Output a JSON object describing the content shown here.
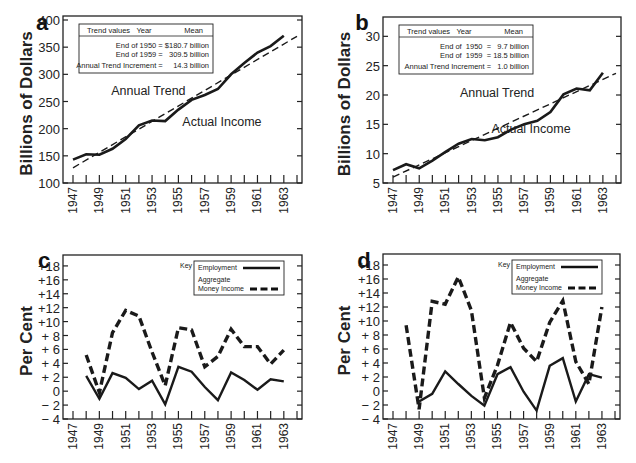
{
  "chart_data": [
    {
      "id": "a",
      "type": "line",
      "panel_label": "a",
      "ylabel": "Billions of Dollars",
      "ylim": [
        100,
        400
      ],
      "yticks": [
        100,
        150,
        200,
        250,
        300,
        350,
        400
      ],
      "ytick_labels": [
        "100",
        "150",
        "200",
        "250",
        "300",
        "350",
        "400"
      ],
      "xlim": [
        1947,
        1964
      ],
      "xtick_labels": [
        "1947",
        "1949",
        "1951",
        "1953",
        "1955",
        "1957",
        "1959",
        "1961",
        "1963"
      ],
      "x": [
        1947,
        1948,
        1949,
        1950,
        1951,
        1952,
        1953,
        1954,
        1955,
        1956,
        1957,
        1958,
        1959,
        1960,
        1961,
        1962,
        1963
      ],
      "series": [
        {
          "name": "Actual Income",
          "style": "solid",
          "values": [
            143,
            153,
            152,
            163,
            181,
            206,
            215,
            214,
            235,
            253,
            262,
            273,
            300,
            321,
            340,
            352,
            371
          ]
        },
        {
          "name": "Annual Trend",
          "style": "dashed",
          "x": [
            1947,
            1964
          ],
          "values": [
            128,
            370
          ]
        }
      ],
      "annotations": [
        {
          "text": "Annual Trend",
          "x": 1949.9,
          "y": 262
        },
        {
          "text": "Actual Income",
          "x": 1955.3,
          "y": 205
        }
      ],
      "table": {
        "headers": [
          "Trend values",
          "Year",
          "Mean"
        ],
        "rows": [
          "End of 1950 = $180.7 billion",
          "End of 1959 =   309.5 billion",
          "Annual Trend Increment =     14.3 billion"
        ]
      },
      "grid": false
    },
    {
      "id": "b",
      "type": "line",
      "panel_label": "b",
      "ylabel": "Billions of Dollars",
      "ylim": [
        5,
        35
      ],
      "yticks": [
        5,
        10,
        15,
        20,
        25,
        30
      ],
      "ytick_labels": [
        "5",
        "10",
        "15",
        "20",
        "25",
        "30"
      ],
      "xlim": [
        1947,
        1964
      ],
      "xtick_labels": [
        "1947",
        "1949",
        "1951",
        "1953",
        "1955",
        "1957",
        "1959",
        "1961",
        "1963"
      ],
      "x": [
        1947,
        1948,
        1949,
        1950,
        1951,
        1952,
        1953,
        1954,
        1955,
        1956,
        1957,
        1958,
        1959,
        1960,
        1961,
        1962,
        1963
      ],
      "series": [
        {
          "name": "Actual Income",
          "style": "solid",
          "values": [
            7.2,
            8.2,
            7.5,
            8.8,
            10.3,
            11.7,
            12.5,
            12.3,
            12.8,
            14.1,
            15.0,
            15.6,
            17.1,
            20.1,
            21.1,
            20.8,
            23.8
          ]
        },
        {
          "name": "Annual Trend",
          "style": "dashed",
          "x": [
            1947,
            1964
          ],
          "values": [
            6.0,
            23.7
          ]
        }
      ],
      "annotations": [
        {
          "text": "Annual Trend",
          "x": 1952.1,
          "y": 19.6
        },
        {
          "text": "Actual Income",
          "x": 1954.5,
          "y": 13.5
        }
      ],
      "table": {
        "headers": [
          "Trend values",
          "Year",
          "Mean"
        ],
        "rows": [
          "End of  1950  =   9.7 billion",
          "End of  1959  = 18.5 billion",
          "Annual Trend Increment =   1.0 billion"
        ]
      },
      "grid": false
    },
    {
      "id": "c",
      "type": "line",
      "panel_label": "c",
      "ylabel": "Per Cent",
      "ylim": [
        -4,
        20
      ],
      "yticks": [
        -4,
        -2,
        0,
        2,
        4,
        6,
        8,
        10,
        12,
        14,
        16,
        18
      ],
      "ytick_labels": [
        "− 4",
        "− 2",
        "0",
        "+ 2",
        "+ 4",
        "+ 6",
        "+ 8",
        "+10",
        "+12",
        "+14",
        "+16",
        "+18"
      ],
      "xlim": [
        1947,
        1964
      ],
      "xtick_labels": [
        "1947",
        "1949",
        "1951",
        "1953",
        "1955",
        "1957",
        "1959",
        "1961",
        "1963"
      ],
      "legend": {
        "key_label": "Key",
        "entries": [
          "Employment",
          "Aggregate",
          "Money Income"
        ],
        "position": "top-right"
      },
      "series": [
        {
          "name": "Employment",
          "style": "solid",
          "x": [
            1948,
            1949,
            1950,
            1951,
            1952,
            1953,
            1954,
            1955,
            1956,
            1957,
            1958,
            1959,
            1960,
            1961,
            1962,
            1963
          ],
          "values": [
            2.2,
            -1.1,
            2.6,
            1.9,
            0.3,
            1.5,
            -1.9,
            3.5,
            2.8,
            0.6,
            -1.3,
            2.7,
            1.6,
            0.2,
            1.7,
            1.4
          ]
        },
        {
          "name": "Aggregate Money Income",
          "style": "dashed",
          "x": [
            1948,
            1949,
            1950,
            1951,
            1952,
            1953,
            1954,
            1955,
            1956,
            1957,
            1958,
            1959,
            1960,
            1961,
            1962,
            1963
          ],
          "values": [
            5.2,
            -0.2,
            8.4,
            11.6,
            10.8,
            5.6,
            0.8,
            9.1,
            8.8,
            3.5,
            5.0,
            8.9,
            6.4,
            6.4,
            3.9,
            5.9
          ]
        }
      ],
      "grid": false
    },
    {
      "id": "d",
      "type": "line",
      "panel_label": "d",
      "ylabel": "Per Cent",
      "ylim": [
        -4,
        20
      ],
      "yticks": [
        -4,
        -2,
        0,
        2,
        4,
        6,
        8,
        10,
        12,
        14,
        16,
        18
      ],
      "ytick_labels": [
        "− 4",
        "− 2",
        "0",
        "+ 2",
        "+ 4",
        "+ 6",
        "+ 8",
        "+10",
        "+12",
        "+14",
        "+16",
        "+18"
      ],
      "xlim": [
        1947,
        1964
      ],
      "xtick_labels": [
        "1947",
        "1949",
        "1951",
        "1953",
        "1955",
        "1957",
        "1959",
        "1961",
        "1963"
      ],
      "legend": {
        "key_label": "Key",
        "entries": [
          "Employment",
          "Aggregate",
          "Money Income"
        ],
        "position": "top-right"
      },
      "series": [
        {
          "name": "Employment",
          "style": "solid",
          "x": [
            1949,
            1950,
            1951,
            1952,
            1953,
            1954,
            1955,
            1956,
            1957,
            1958,
            1959,
            1960,
            1961,
            1962,
            1963
          ],
          "values": [
            -1.5,
            -0.4,
            2.8,
            1.0,
            -0.7,
            -2.1,
            2.4,
            3.4,
            -0.1,
            -2.8,
            3.6,
            4.7,
            -1.5,
            2.4,
            1.9
          ]
        },
        {
          "name": "Aggregate Money Income",
          "style": "dashed",
          "x": [
            1948,
            1949,
            1950,
            1951,
            1952,
            1953,
            1954,
            1955,
            1956,
            1957,
            1958,
            1959,
            1960,
            1961,
            1962,
            1963
          ],
          "values": [
            9.4,
            -2.6,
            12.8,
            12.4,
            16.3,
            11.5,
            -1.0,
            3.7,
            9.8,
            6.1,
            4.2,
            9.8,
            12.9,
            4.2,
            1.0,
            12.0
          ]
        }
      ],
      "grid": false
    }
  ]
}
